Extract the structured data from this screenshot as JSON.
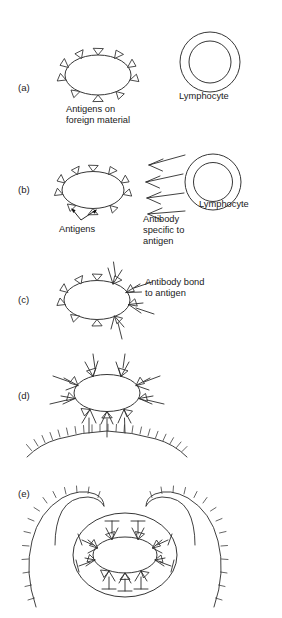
{
  "figure": {
    "background_color": "#ffffff",
    "ink_color": "#2b2b2b",
    "width": 282,
    "height": 618
  },
  "panels": [
    {
      "id": "a",
      "letter": "(a)",
      "description": "Foreign material bearing surface antigens and a lymphocyte",
      "labels": [
        {
          "name": "antigens-on-foreign-material",
          "lines": [
            "Antigens on",
            "foreign material"
          ]
        },
        {
          "name": "lymphocyte",
          "lines": [
            "Lymphocyte"
          ]
        }
      ]
    },
    {
      "id": "b",
      "letter": "(b)",
      "description": "Lymphocyte releases antibodies specific to the antigen",
      "labels": [
        {
          "name": "antigens",
          "lines": [
            "Antigens"
          ]
        },
        {
          "name": "antibody-specific-to-antigen",
          "lines": [
            "Antibody",
            "specific to",
            "antigen"
          ]
        },
        {
          "name": "lymphocyte",
          "lines": [
            "Lymphocyte"
          ]
        }
      ]
    },
    {
      "id": "c",
      "letter": "(c)",
      "description": "Antibodies bond to the antigens on the foreign material",
      "labels": [
        {
          "name": "antibody-bond-to-antigen",
          "lines": [
            "Antibody bond",
            "to antigen"
          ]
        }
      ]
    },
    {
      "id": "d",
      "letter": "(d)",
      "description": "Antibody coated material attaches to the phagocyte membrane",
      "labels": []
    },
    {
      "id": "e",
      "letter": "(e)",
      "description": "Phagocyte engulfs the antibody coated foreign material",
      "labels": []
    }
  ],
  "legend_terms": {
    "antigen": "Antigen",
    "antibody": "Antibody",
    "lymphocyte": "Lymphocyte",
    "foreign_material": "Foreign material",
    "phagocyte_membrane": "Phagocyte membrane"
  }
}
